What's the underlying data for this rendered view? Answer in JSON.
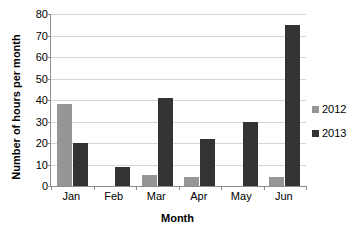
{
  "chart_data": {
    "type": "bar",
    "title": "",
    "xlabel": "Month",
    "ylabel": "Number of hours per month",
    "categories": [
      "Jan",
      "Feb",
      "Mar",
      "Apr",
      "May",
      "Jun"
    ],
    "series": [
      {
        "name": "2012",
        "color": "#969696",
        "values": [
          38,
          0,
          5,
          4,
          0,
          4
        ]
      },
      {
        "name": "2013",
        "color": "#333333",
        "values": [
          20,
          9,
          41,
          22,
          30,
          75
        ]
      }
    ],
    "ylim": [
      0,
      80
    ],
    "yticks": [
      0,
      10,
      20,
      30,
      40,
      50,
      60,
      70,
      80
    ],
    "ytick_labels": [
      "0",
      "10",
      "20",
      "30",
      "40",
      "50",
      "60",
      "70",
      "80"
    ],
    "grid": true,
    "legend_position": "right"
  }
}
